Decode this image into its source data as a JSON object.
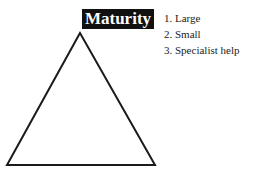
{
  "diagram": {
    "title": "Maturity",
    "items": [
      {
        "label": "1. Large"
      },
      {
        "label": "2. Small"
      },
      {
        "label": "3. Specialist help"
      }
    ],
    "shape": "triangle",
    "colors": {
      "title_bg": "#111111",
      "title_fg": "#ffffff",
      "stroke": "#1a1a1a"
    }
  }
}
